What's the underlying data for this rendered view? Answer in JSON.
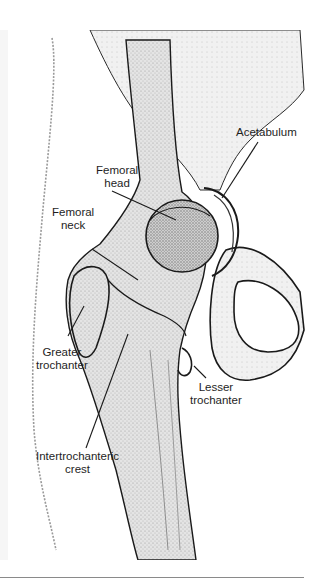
{
  "figure": {
    "caption_cutoff": "",
    "colors": {
      "background": "#ffffff",
      "bone_fill": "#d9d9d9",
      "bone_fill_dark": "#b8b8b8",
      "outline": "#1a1a1a",
      "label_text": "#1e1e1e",
      "leader_line": "#1a1a1a",
      "rule": "#8a8a8a"
    },
    "labels": {
      "femoral_head": {
        "line1": "Femoral",
        "line2": "head"
      },
      "acetabulum": {
        "line1": "Acetabulum"
      },
      "femoral_neck": {
        "line1": "Femoral",
        "line2": "neck"
      },
      "greater_trochanter": {
        "line1": "Greater",
        "line2": "trochanter"
      },
      "lesser_trochanter": {
        "line1": "Lesser",
        "line2": "trochanter"
      },
      "intertrochanteric_crest": {
        "line1": "Intertrochanteric",
        "line2": "crest"
      }
    }
  }
}
